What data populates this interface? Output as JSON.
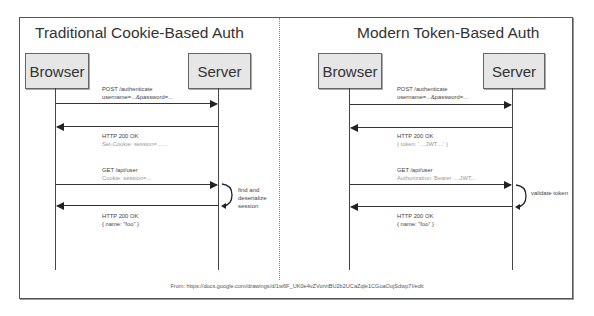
{
  "source": "From: https://docs.google.com/drawings/d/1w6F_UK0e4vZVorvtBU2b2UCaZqle1CGoaOojSdwp7I/edit",
  "panels": [
    {
      "title": "Traditional Cookie-Based Auth",
      "browser_label": "Browser",
      "server_label": "Server",
      "messages": [
        {
          "line1": "POST /authenticate",
          "line2": "username=...&password=...",
          "direction": "browser-to-server"
        },
        {
          "line1": "HTTP 200 OK",
          "line2": "Set-Cookie: session=.......",
          "direction": "server-to-browser"
        },
        {
          "line1": "GET /api/user",
          "line2": "Cookie: session=...",
          "direction": "browser-to-server"
        },
        {
          "line1": "HTTP 200 OK",
          "line2": "{ name: \"foo\" }",
          "direction": "server-to-browser"
        }
      ],
      "server_note": [
        "find and",
        "deserialize",
        "session"
      ]
    },
    {
      "title": "Modern Token-Based Auth",
      "browser_label": "Browser",
      "server_label": "Server",
      "messages": [
        {
          "line1": "POST /authenticate",
          "line2": "username=...&password=...",
          "direction": "browser-to-server"
        },
        {
          "line1": "HTTP 200 OK",
          "line2": "{ token: '....JWT....' }",
          "direction": "server-to-browser"
        },
        {
          "line1": "GET /api/user",
          "line2": "Authorization: Bearer ....JWT...",
          "direction": "browser-to-server"
        },
        {
          "line1": "HTTP 200 OK",
          "line2": "{ name: \"foo\" }",
          "direction": "server-to-browser"
        }
      ],
      "server_note": [
        "validate token"
      ]
    }
  ]
}
